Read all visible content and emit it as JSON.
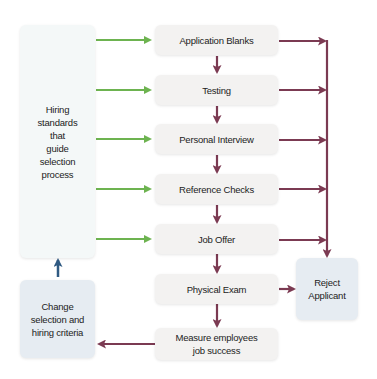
{
  "colors": {
    "green_arrow": "#6db350",
    "maroon_arrow": "#7b3a52",
    "blue_arrow": "#2f5a82",
    "process_box": "#f3f2f1",
    "standards_box": "#f4f8f8",
    "blue_box": "#e6ecf2"
  },
  "standards_box": {
    "label": "Hiring\nstandards\nthat\nguide\nselection\nprocess"
  },
  "steps": [
    {
      "label": "Application Blanks"
    },
    {
      "label": "Testing"
    },
    {
      "label": "Personal Interview"
    },
    {
      "label": "Reference Checks"
    },
    {
      "label": "Job Offer"
    },
    {
      "label": "Physical Exam"
    },
    {
      "label": "Measure employees\njob success"
    }
  ],
  "reject_box": {
    "label": "Reject\nApplicant"
  },
  "change_box": {
    "label": "Change\nselection and\nhiring criteria"
  }
}
